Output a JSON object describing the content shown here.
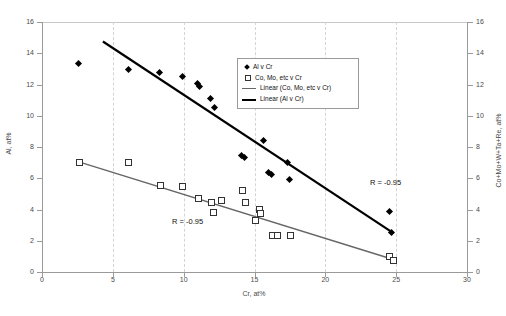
{
  "chart_data": {
    "type": "scatter",
    "title": "",
    "xlabel": "Cr, at%",
    "ylabel": "Al, at%",
    "ylabel_right": "Co+Mo+W+Ta+Re, at%",
    "xlim": [
      0,
      30
    ],
    "ylim": [
      0,
      16
    ],
    "ylim_right": [
      0,
      16
    ],
    "xticks": [
      0,
      5,
      10,
      15,
      20,
      25,
      30
    ],
    "yticks": [
      0,
      2,
      4,
      6,
      8,
      10,
      12,
      14,
      16
    ],
    "yticks_right": [
      0,
      2,
      4,
      6,
      8,
      10,
      12,
      14,
      16
    ],
    "grid": true,
    "grid_style": "dashed-vertical-light-gray",
    "legend_position": "upper-right-inside",
    "series": [
      {
        "name": "Al v Cr",
        "marker": "filled-diamond",
        "color": "#000000",
        "axis": "left",
        "points": [
          [
            2.6,
            13.35
          ],
          [
            6.1,
            12.95
          ],
          [
            8.3,
            12.75
          ],
          [
            9.9,
            12.5
          ],
          [
            11.0,
            12.05
          ],
          [
            11.1,
            11.85
          ],
          [
            11.9,
            11.1
          ],
          [
            12.2,
            10.55
          ],
          [
            14.1,
            7.45
          ],
          [
            14.3,
            7.3
          ],
          [
            15.6,
            8.4
          ],
          [
            16.0,
            6.4
          ],
          [
            16.2,
            6.25
          ],
          [
            17.3,
            7.0
          ],
          [
            17.5,
            5.95
          ],
          [
            24.5,
            3.85
          ],
          [
            24.7,
            2.5
          ]
        ]
      },
      {
        "name": "Co, Mo, etc v Cr",
        "marker": "open-square",
        "color": "#333333",
        "axis": "right",
        "points": [
          [
            2.6,
            7.05
          ],
          [
            6.1,
            7.05
          ],
          [
            8.3,
            5.55
          ],
          [
            9.9,
            5.5
          ],
          [
            11.0,
            4.75
          ],
          [
            11.9,
            4.45
          ],
          [
            12.1,
            3.85
          ],
          [
            12.6,
            4.6
          ],
          [
            14.1,
            5.25
          ],
          [
            14.3,
            4.5
          ],
          [
            15.3,
            4.05
          ],
          [
            15.4,
            3.8
          ],
          [
            15.0,
            3.3
          ],
          [
            16.2,
            2.35
          ],
          [
            16.6,
            2.4
          ],
          [
            17.5,
            2.35
          ],
          [
            24.5,
            1.0
          ],
          [
            24.8,
            0.8
          ]
        ]
      }
    ],
    "trendlines": [
      {
        "name": "Linear (Al v Cr)",
        "color": "#000000",
        "width": 2.2,
        "axis": "left",
        "x_start": 4.3,
        "y_start": 14.75,
        "x_end": 24.7,
        "y_end": 2.55,
        "annotation": "R = -0.95"
      },
      {
        "name": "Linear (Co, Mo, etc v Cr)",
        "color": "#666666",
        "width": 1.4,
        "axis": "right",
        "x_start": 2.6,
        "y_start": 7.05,
        "x_end": 24.8,
        "y_end": 0.8,
        "annotation": "R = -0.95"
      }
    ],
    "annotations": [
      {
        "text": "R = -0.95",
        "x": 21.5,
        "y": 5.9,
        "series": "Al v Cr"
      },
      {
        "text": "R = -0.95",
        "x": 9.5,
        "y": 3.4,
        "series": "Co, Mo, etc v Cr"
      }
    ],
    "legend": [
      {
        "label": "Al v Cr",
        "marker": "filled-diamond"
      },
      {
        "label": "Co, Mo, etc v Cr",
        "marker": "open-square"
      },
      {
        "label": "Linear (Co, Mo, etc v Cr)",
        "marker": "thin-line"
      },
      {
        "label": "Linear (Al v Cr)",
        "marker": "thick-line"
      }
    ]
  }
}
